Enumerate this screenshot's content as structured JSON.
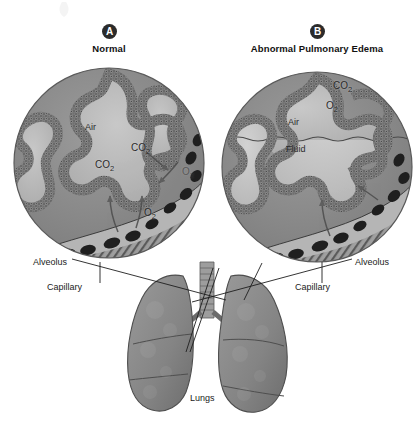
{
  "figure": {
    "kind": "medical-illustration"
  },
  "panels": [
    {
      "id": "A",
      "badge": "A",
      "title": "Normal",
      "title_x": 109,
      "title_y": 44,
      "badge_x": 102,
      "badge_y": 24,
      "circle": {
        "cx": 109,
        "cy": 163,
        "r": 95
      },
      "inner_labels": [
        {
          "text": "Air",
          "x": 85,
          "y": 128,
          "name": "air-label"
        }
      ],
      "gas_labels": [
        {
          "formula": "CO",
          "sub": "2",
          "x": 131,
          "y": 148,
          "name": "co2-label-1"
        },
        {
          "formula": "CO",
          "sub": "2",
          "x": 95,
          "y": 165,
          "name": "co2-label-2"
        },
        {
          "formula": "O",
          "sub": "2",
          "x": 182,
          "y": 172,
          "name": "o2-label-1"
        },
        {
          "formula": "O",
          "sub": "2",
          "x": 144,
          "y": 213,
          "name": "o2-label-2"
        }
      ],
      "callouts": [
        {
          "text": "Alveolus",
          "x": 33,
          "y": 262,
          "name": "alveolus-callout"
        },
        {
          "text": "Capillary",
          "x": 47,
          "y": 287,
          "name": "capillary-callout"
        }
      ]
    },
    {
      "id": "B",
      "badge": "B",
      "title": "Abnormal Pulmonary Edema",
      "title_x": 317,
      "title_y": 44,
      "badge_x": 310,
      "badge_y": 24,
      "circle": {
        "cx": 317,
        "cy": 167,
        "r": 95
      },
      "inner_labels": [
        {
          "text": "Air",
          "x": 288,
          "y": 123,
          "name": "air-label"
        },
        {
          "text": "Fluid",
          "x": 286,
          "y": 150,
          "name": "fluid-label"
        }
      ],
      "gas_labels": [
        {
          "formula": "CO",
          "sub": "2",
          "x": 333,
          "y": 86,
          "name": "co2-label-1"
        },
        {
          "formula": "O",
          "sub": "2",
          "x": 326,
          "y": 106,
          "name": "o2-label-1"
        }
      ],
      "callouts": [
        {
          "text": "Alveolus",
          "x": 355,
          "y": 262,
          "name": "alveolus-callout"
        },
        {
          "text": "Capillary",
          "x": 295,
          "y": 287,
          "name": "capillary-callout"
        }
      ]
    }
  ],
  "lungs": {
    "label": "Lungs",
    "label_x": 190,
    "label_y": 395
  },
  "colors": {
    "background": "#ffffff",
    "badge_fill": "#2b2b2b",
    "badge_text": "#ffffff",
    "alveolar_wall": "#6f6f6f",
    "alveolar_wall_dark": "#4a4a4a",
    "air_space": "#b9b9b9",
    "tissue_bg": "#8f8f8f",
    "fluid": "#c9c9c9",
    "capillary_lumen": "#bdbdbd",
    "red_cell": "#242424",
    "lung_body": "#8a8a8a",
    "lung_shade": "#6e6e6e",
    "trachea": "#9a9a9a",
    "leader_line": "#1e1e1e",
    "arrow": "#555555",
    "text": "#1a1a1a"
  }
}
